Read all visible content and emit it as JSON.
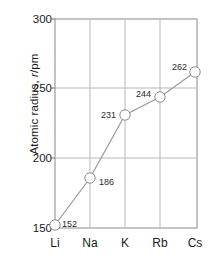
{
  "chart_data": {
    "type": "line",
    "title": "",
    "subtitle": "",
    "xlabel": "",
    "ylabel": "Atomic radius, r/pm",
    "ylabel_parts": {
      "prefix": "Atomic radius, ",
      "italic": "r",
      "suffix": "/pm"
    },
    "categories": [
      "Li",
      "Na",
      "K",
      "Rb",
      "Cs"
    ],
    "values": [
      152,
      186,
      231,
      244,
      262
    ],
    "point_labels": [
      "152",
      "186",
      "231",
      "244",
      "262"
    ],
    "ylim": [
      150,
      300
    ],
    "yticks": [
      150,
      200,
      250,
      300
    ],
    "ytick_labels": [
      "150",
      "200",
      "250",
      "300"
    ],
    "grid": true,
    "grid_axis": "both",
    "legend": false,
    "legend_position": "none",
    "marker": "open-circle",
    "colors": {
      "line": "#9a9a9a",
      "marker_fill": "#ffffff",
      "marker_stroke": "#8c8c8c",
      "grid": "#b8b8b8",
      "axis": "#6e6e6e",
      "text": "#1a1a1a",
      "background": "#ffffff"
    }
  },
  "axes": {
    "y_title": "Atomic radius, r/pm",
    "y_ticks": [
      {
        "value": "300",
        "y": 19
      },
      {
        "value": "250",
        "y": 88
      },
      {
        "value": "200",
        "y": 158
      },
      {
        "value": "150",
        "y": 228
      }
    ],
    "x_ticks": [
      {
        "label": "Li",
        "x": 55
      },
      {
        "label": "Na",
        "x": 90
      },
      {
        "label": "K",
        "x": 125
      },
      {
        "label": "Rb",
        "x": 160
      },
      {
        "label": "Cs",
        "x": 195
      }
    ]
  },
  "points": [
    {
      "label": "152",
      "category": "Li",
      "value": 152,
      "cx": 55,
      "cy": 225,
      "label_x": 62,
      "label_y": 219
    },
    {
      "label": "186",
      "category": "Na",
      "value": 186,
      "cx": 90,
      "cy": 178,
      "label_x": 99,
      "label_y": 177
    },
    {
      "label": "231",
      "category": "K",
      "value": 231,
      "cx": 125,
      "cy": 115,
      "label_x": 101,
      "label_y": 110
    },
    {
      "label": "244",
      "category": "Rb",
      "value": 244,
      "cx": 160,
      "cy": 97,
      "label_x": 136,
      "label_y": 89
    },
    {
      "label": "262",
      "category": "Cs",
      "value": 262,
      "cx": 195,
      "cy": 72,
      "label_x": 172,
      "label_y": 62
    }
  ]
}
